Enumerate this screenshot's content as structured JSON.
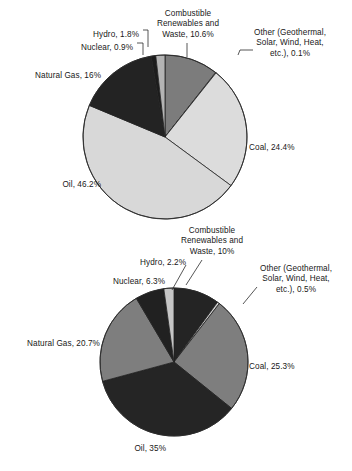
{
  "figure": {
    "background": "#ffffff",
    "caption": ""
  },
  "chart_data": [
    {
      "type": "pie",
      "title": "",
      "name": "world-total-primary-energy-supply",
      "legend_position": "callout-labels",
      "start_angle_deg": -90,
      "direction": "clockwise",
      "center": {
        "x": 165,
        "y": 137
      },
      "radius": 82,
      "categories": [
        "Combustible Renewables and Waste",
        "Other (Geothermal, Solar, Wind, Heat, etc.)",
        "Coal",
        "Oil",
        "Natural Gas",
        "Nuclear",
        "Hydro"
      ],
      "values": [
        10.6,
        0.1,
        24.4,
        46.2,
        16,
        0.9,
        1.8
      ],
      "slices": [
        {
          "key": "crw",
          "label": "Combustible\nRenewables and\nWaste, 10.6%",
          "value": 10.6,
          "color": "#7c7c7c"
        },
        {
          "key": "other",
          "label": "Other (Geothermal,\nSolar, Wind, Heat,\netc.), 0.1%",
          "value": 0.1,
          "color": "#e2e2e2"
        },
        {
          "key": "coal",
          "label": "Coal, 24.4%",
          "value": 24.4,
          "color": "#dcdcdc"
        },
        {
          "key": "oil",
          "label": "Oil, 46.2%",
          "value": 46.2,
          "color": "#d8d8d8"
        },
        {
          "key": "gas",
          "label": "Natural Gas, 16%",
          "value": 16,
          "color": "#232323"
        },
        {
          "key": "nuclear",
          "label": "Nuclear, 0.9%",
          "value": 0.9,
          "color": "#1c1c1c"
        },
        {
          "key": "hydro",
          "label": "Hydro, 1.8%",
          "value": 1.8,
          "color": "#b4b4b4"
        }
      ],
      "labels": [
        {
          "key": "crw",
          "text": "Combustible\nRenewables and\nWaste, 10.6%",
          "x": 188,
          "y": 9,
          "align": "ctr"
        },
        {
          "key": "other",
          "text": "Other (Geothermal,\nSolar, Wind, Heat,\netc.), 0.1%",
          "x": 290,
          "y": 28,
          "align": "ctr"
        },
        {
          "key": "hydro",
          "text": "Hydro, 1.8%",
          "x": 139,
          "y": 30,
          "align": "rt"
        },
        {
          "key": "nuclear",
          "text": "Nuclear, 0.9%",
          "x": 133,
          "y": 43,
          "align": "rt"
        },
        {
          "key": "gas",
          "text": "Natural Gas, 16%",
          "x": 101,
          "y": 71,
          "align": "rt"
        },
        {
          "key": "oil",
          "text": "Oil, 46.2%",
          "x": 101,
          "y": 180,
          "align": "rt"
        },
        {
          "key": "coal",
          "text": "Coal, 24.4%",
          "x": 249,
          "y": 143,
          "align": "lt"
        }
      ]
    },
    {
      "type": "pie",
      "title": "",
      "name": "oecd-total-primary-energy-supply",
      "legend_position": "callout-labels",
      "start_angle_deg": -90,
      "direction": "clockwise",
      "center": {
        "x": 174,
        "y": 362
      },
      "radius": 74,
      "categories": [
        "Combustible Renewables and Waste",
        "Other (Geothermal, Solar, Wind, Heat, etc.)",
        "Coal",
        "Oil",
        "Natural Gas",
        "Nuclear",
        "Hydro"
      ],
      "values": [
        10,
        0.5,
        25.3,
        35,
        20.7,
        6.3,
        2.2
      ],
      "slices": [
        {
          "key": "crw",
          "label": "Combustible\nRenewables and\nWaste, 10%",
          "value": 10,
          "color": "#242424"
        },
        {
          "key": "other",
          "label": "Other (Geothermal,\nSolar, Wind, Heat,\netc.), 0.5%",
          "value": 0.5,
          "color": "#cfcfcf"
        },
        {
          "key": "coal",
          "label": "Coal, 25.3%",
          "value": 25.3,
          "color": "#7e7e7e"
        },
        {
          "key": "oil",
          "label": "Oil, 35%",
          "value": 35,
          "color": "#252525"
        },
        {
          "key": "gas",
          "label": "Natural Gas, 20.7%",
          "value": 20.7,
          "color": "#7e7e7e"
        },
        {
          "key": "nuclear",
          "label": "Nuclear, 6.3%",
          "value": 6.3,
          "color": "#212121"
        },
        {
          "key": "hydro",
          "label": "Hydro, 2.2%",
          "value": 2.2,
          "color": "#c6c6c6"
        }
      ],
      "labels": [
        {
          "key": "crw",
          "text": "Combustible\nRenewables and\nWaste, 10%",
          "x": 212,
          "y": 226,
          "align": "ctr"
        },
        {
          "key": "other",
          "text": "Other (Geothermal,\nSolar, Wind, Heat,\netc.), 0.5%",
          "x": 296,
          "y": 264,
          "align": "ctr"
        },
        {
          "key": "hydro",
          "text": "Hydro, 2.2%",
          "x": 186,
          "y": 258,
          "align": "rt"
        },
        {
          "key": "nuclear",
          "text": "Nuclear, 6.3%",
          "x": 165,
          "y": 277,
          "align": "rt"
        },
        {
          "key": "gas",
          "text": "Natural Gas, 20.7%",
          "x": 100,
          "y": 339,
          "align": "rt"
        },
        {
          "key": "oil",
          "text": "Oil, 35%",
          "x": 166,
          "y": 444,
          "align": "rt"
        },
        {
          "key": "coal",
          "text": "Coal, 25.3%",
          "x": 249,
          "y": 362,
          "align": "lt"
        }
      ]
    }
  ],
  "leader_lines": [
    {
      "chart": 0,
      "key": "crw",
      "points": "187,43 187,57"
    },
    {
      "chart": 0,
      "key": "other",
      "points": "238,55 240,50 253,50"
    },
    {
      "chart": 0,
      "key": "hydro",
      "points": "143,30 148,30 148,47"
    },
    {
      "chart": 0,
      "key": "nuclear",
      "points": "137,43 143,43 143,55"
    },
    {
      "chart": 1,
      "key": "crw",
      "points": "186,285 202,260"
    },
    {
      "chart": 1,
      "key": "hydro",
      "points": "172,290 186,265"
    },
    {
      "chart": 1,
      "key": "other",
      "points": "243,304 257,287"
    }
  ]
}
